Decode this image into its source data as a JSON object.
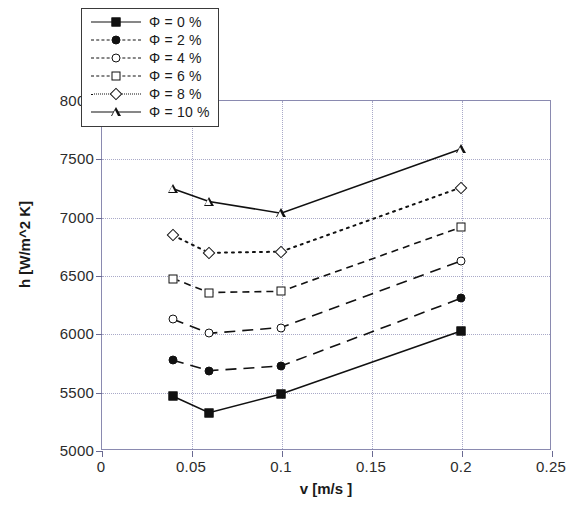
{
  "chart_data": {
    "type": "line",
    "title": "",
    "xlabel": "v [m/s ]",
    "ylabel": "h [W/m^2 K]",
    "xlim": [
      0,
      0.25
    ],
    "ylim": [
      5000,
      8000
    ],
    "xticks": [
      "0",
      "0.05",
      "0.1",
      "0.15",
      "0.2",
      "0.25"
    ],
    "xtick_values": [
      0,
      0.05,
      0.1,
      0.15,
      0.2,
      0.25
    ],
    "yticks": [
      "5000",
      "5500",
      "6000",
      "6500",
      "7000",
      "7500",
      "8000"
    ],
    "ytick_values": [
      5000,
      5500,
      6000,
      6500,
      7000,
      7500,
      8000
    ],
    "grid": true,
    "legend_position": "top-left",
    "x": [
      0.04,
      0.06,
      0.1,
      0.2
    ],
    "series": [
      {
        "name": "Φ = 0 %",
        "marker": "square-filled",
        "linestyle": "solid",
        "values": [
          5460,
          5320,
          5480,
          6020
        ]
      },
      {
        "name": "Φ = 2 %",
        "marker": "circle-filled",
        "linestyle": "dash-long",
        "values": [
          5770,
          5680,
          5720,
          6300
        ]
      },
      {
        "name": "Φ = 4 %",
        "marker": "circle-open",
        "linestyle": "dash-long",
        "values": [
          6120,
          6000,
          6050,
          6620
        ]
      },
      {
        "name": "Φ = 6 %",
        "marker": "square-open",
        "linestyle": "dash",
        "values": [
          6470,
          6350,
          6360,
          6910
        ]
      },
      {
        "name": "Φ = 8 %",
        "marker": "diamond-open",
        "linestyle": "dot",
        "values": [
          6840,
          6690,
          6700,
          7250
        ]
      },
      {
        "name": "Φ = 10 %",
        "marker": "triangle-open",
        "linestyle": "solid",
        "values": [
          7240,
          7130,
          7030,
          7580
        ]
      }
    ]
  },
  "legend": {
    "entries": [
      {
        "label": "Φ = 0 %",
        "marker": "square-filled",
        "linestyle": "solid"
      },
      {
        "label": "Φ = 2 %",
        "marker": "circle-filled",
        "linestyle": "dash-long"
      },
      {
        "label": "Φ = 4 %",
        "marker": "circle-open",
        "linestyle": "dash-long"
      },
      {
        "label": "Φ = 6 %",
        "marker": "square-open",
        "linestyle": "dash"
      },
      {
        "label": "Φ = 8 %",
        "marker": "diamond-open",
        "linestyle": "dot"
      },
      {
        "label": "Φ = 10 %",
        "marker": "triangle-open",
        "linestyle": "solid"
      }
    ]
  },
  "colors": {
    "line": "#111111",
    "grid": "#a9a9c8",
    "frame": "#8a8ab0",
    "text": "#1a1a1a",
    "background": "#ffffff"
  }
}
